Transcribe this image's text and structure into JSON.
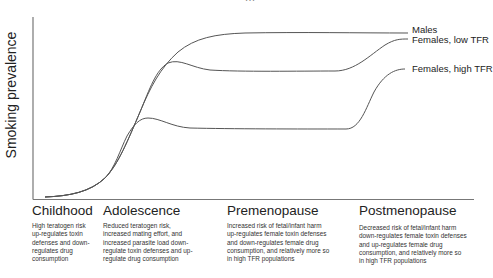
{
  "figure": {
    "title_clipped": "…",
    "ylabel": "Smoking prevalence",
    "series": [
      {
        "name": "Males",
        "label": "Males",
        "color": "#555555"
      },
      {
        "name": "Females, low TFR",
        "label": "Females, low TFR",
        "color": "#555555"
      },
      {
        "name": "Females, high TFR",
        "label": "Females, high TFR",
        "color": "#555555"
      }
    ],
    "stages": [
      {
        "heading": "Childhood",
        "description": "High teratogen risk up-regulates toxin defenses and down-regulates drug consumption"
      },
      {
        "heading": "Adolescence",
        "description": "Reduced teratogen risk, increased mating effort, and increased parasite load down-regulate toxin defenses and up-regulate drug consumption"
      },
      {
        "heading": "Premenopause",
        "description": "Increased risk of fetal/infant harm up-regulates female toxin defenses and down-regulates female drug consumption, and relatively more so in high TFR populations"
      },
      {
        "heading": "Postmenopause",
        "description": "Decreased risk of fetal/infant harm down-regulates female toxin defenses and up-regulates female drug consumption, and relatively more so in high TFR populations"
      }
    ]
  }
}
